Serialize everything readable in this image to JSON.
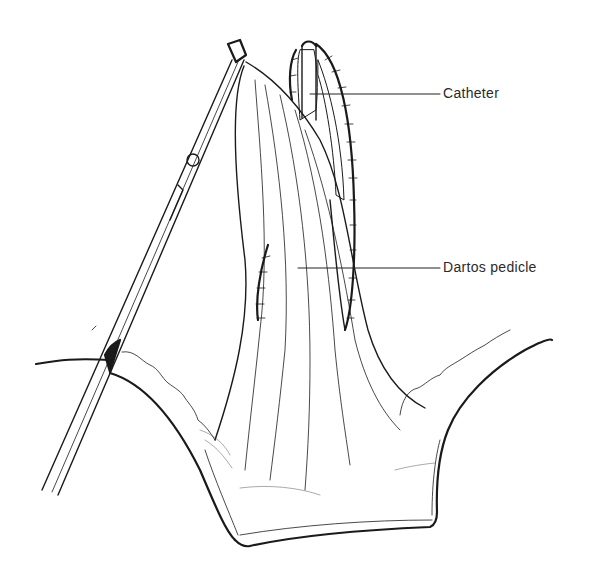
{
  "figure": {
    "type": "surgical line illustration",
    "labels": [
      {
        "id": "catheter",
        "text": "Catheter"
      },
      {
        "id": "dartos-pedicle",
        "text": "Dartos pedicle"
      }
    ],
    "colors": {
      "ink": "#1a1a1a",
      "label_text": "#2a2a2a",
      "background": "#ffffff",
      "stipple": "#777777"
    }
  }
}
